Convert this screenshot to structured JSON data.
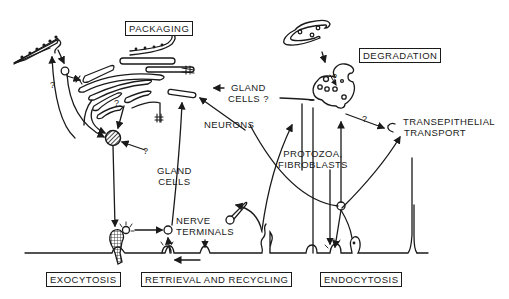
{
  "diagram": {
    "process_boxes": {
      "packaging": "PACKAGING",
      "degradation": "DEGRADATION",
      "exocytosis": "EXOCYTOSIS",
      "retrieval_recycling": "RETRIEVAL AND RECYCLING",
      "endocytosis": "ENDOCYTOSIS"
    },
    "labels": {
      "gland_cells_top": [
        "GLAND",
        "CELLS ?"
      ],
      "neurons": "NEURONS",
      "protozoa_fibroblasts": [
        "PROTOZOA,",
        "FIBROBLASTS"
      ],
      "transepithelial_transport": [
        "TRANSEPITHELIAL",
        "TRANSPORT"
      ],
      "gland_cells_mid": [
        "GLAND",
        "CELLS"
      ],
      "nerve_terminals": [
        "NERVE",
        "TERMINALS"
      ],
      "question_mark": "?"
    },
    "colors": {
      "ink": "#1a1a1a",
      "background": "#ffffff"
    }
  }
}
